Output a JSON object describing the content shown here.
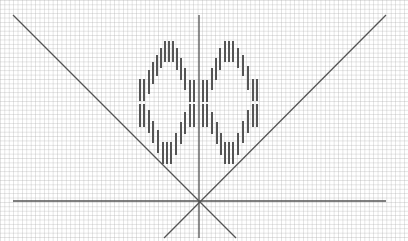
{
  "figure": {
    "background": "#ffffff",
    "grid_color": "#dcdcdc",
    "line_color": "#555555",
    "dash_color": "#555555"
  },
  "lines": [
    {
      "name": "left-diagonal",
      "x1": 13,
      "y1": 15,
      "x2": 236,
      "y2": 238
    },
    {
      "name": "right-diagonal",
      "x1": 386,
      "y1": 15,
      "x2": 164,
      "y2": 238
    },
    {
      "name": "vertical-axis",
      "x1": 199,
      "y1": 15,
      "x2": 199,
      "y2": 238
    },
    {
      "name": "horizontal-axis",
      "x1": 13,
      "y1": 201,
      "x2": 386,
      "y2": 201
    }
  ],
  "dashes": [
    {
      "x": 140,
      "y1": 79,
      "y2": 101
    },
    {
      "x": 144,
      "y1": 79,
      "y2": 101
    },
    {
      "x": 140,
      "y1": 104,
      "y2": 127
    },
    {
      "x": 144,
      "y1": 104,
      "y2": 127
    },
    {
      "x": 149,
      "y1": 70,
      "y2": 94
    },
    {
      "x": 149,
      "y1": 110,
      "y2": 133
    },
    {
      "x": 153,
      "y1": 62,
      "y2": 84
    },
    {
      "x": 153,
      "y1": 121,
      "y2": 143
    },
    {
      "x": 157,
      "y1": 55,
      "y2": 76
    },
    {
      "x": 158,
      "y1": 130,
      "y2": 153
    },
    {
      "x": 161,
      "y1": 48,
      "y2": 68
    },
    {
      "x": 165,
      "y1": 41,
      "y2": 62
    },
    {
      "x": 169,
      "y1": 41,
      "y2": 62
    },
    {
      "x": 173,
      "y1": 41,
      "y2": 62
    },
    {
      "x": 163,
      "y1": 142,
      "y2": 164
    },
    {
      "x": 167,
      "y1": 142,
      "y2": 164
    },
    {
      "x": 171,
      "y1": 142,
      "y2": 164
    },
    {
      "x": 177,
      "y1": 48,
      "y2": 70
    },
    {
      "x": 176,
      "y1": 133,
      "y2": 155
    },
    {
      "x": 181,
      "y1": 58,
      "y2": 80
    },
    {
      "x": 181,
      "y1": 122,
      "y2": 144
    },
    {
      "x": 185,
      "y1": 68,
      "y2": 90
    },
    {
      "x": 185,
      "y1": 112,
      "y2": 134
    },
    {
      "x": 190,
      "y1": 80,
      "y2": 102
    },
    {
      "x": 190,
      "y1": 104,
      "y2": 127
    },
    {
      "x": 194,
      "y1": 80,
      "y2": 102
    },
    {
      "x": 194,
      "y1": 104,
      "y2": 127
    },
    {
      "x": 203,
      "y1": 80,
      "y2": 102
    },
    {
      "x": 203,
      "y1": 104,
      "y2": 127
    },
    {
      "x": 207,
      "y1": 80,
      "y2": 102
    },
    {
      "x": 207,
      "y1": 104,
      "y2": 127
    },
    {
      "x": 212,
      "y1": 68,
      "y2": 90
    },
    {
      "x": 212,
      "y1": 112,
      "y2": 134
    },
    {
      "x": 216,
      "y1": 58,
      "y2": 80
    },
    {
      "x": 217,
      "y1": 122,
      "y2": 144
    },
    {
      "x": 220,
      "y1": 48,
      "y2": 70
    },
    {
      "x": 221,
      "y1": 133,
      "y2": 155
    },
    {
      "x": 225,
      "y1": 41,
      "y2": 62
    },
    {
      "x": 229,
      "y1": 41,
      "y2": 62
    },
    {
      "x": 233,
      "y1": 41,
      "y2": 62
    },
    {
      "x": 225,
      "y1": 142,
      "y2": 164
    },
    {
      "x": 229,
      "y1": 142,
      "y2": 164
    },
    {
      "x": 233,
      "y1": 142,
      "y2": 164
    },
    {
      "x": 238,
      "y1": 48,
      "y2": 68
    },
    {
      "x": 238,
      "y1": 133,
      "y2": 155
    },
    {
      "x": 243,
      "y1": 55,
      "y2": 76
    },
    {
      "x": 243,
      "y1": 121,
      "y2": 143
    },
    {
      "x": 248,
      "y1": 66,
      "y2": 90
    },
    {
      "x": 248,
      "y1": 110,
      "y2": 133
    },
    {
      "x": 253,
      "y1": 79,
      "y2": 101
    },
    {
      "x": 257,
      "y1": 79,
      "y2": 101
    },
    {
      "x": 253,
      "y1": 104,
      "y2": 127
    },
    {
      "x": 257,
      "y1": 104,
      "y2": 127
    }
  ]
}
